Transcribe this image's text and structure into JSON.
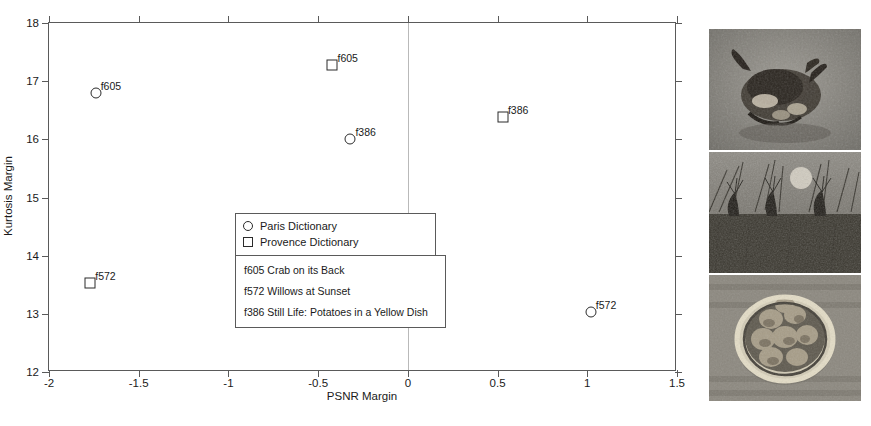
{
  "chart_data": {
    "type": "scatter",
    "title": "",
    "xlabel": "PSNR Margin",
    "ylabel": "Kurtosis Margin",
    "xlim": [
      -2,
      1.5
    ],
    "ylim": [
      12,
      18
    ],
    "xticks": [
      "-2",
      "-1.5",
      "-1",
      "-0.5",
      "0",
      "0.5",
      "1",
      "1.5"
    ],
    "xtick_values": [
      -2,
      -1.5,
      -1,
      -0.5,
      0,
      0.5,
      1,
      1.5
    ],
    "yticks": [
      "12",
      "13",
      "14",
      "15",
      "16",
      "17",
      "18"
    ],
    "ytick_values": [
      12,
      13,
      14,
      15,
      16,
      17,
      18
    ],
    "grid": false,
    "reference_line_x": 0,
    "legend_position": "center-left",
    "series": [
      {
        "name": "Paris Dictionary",
        "marker": "circle",
        "points": [
          {
            "label": "f605",
            "x": -1.74,
            "y": 16.8
          },
          {
            "label": "f386",
            "x": -0.32,
            "y": 16.0
          },
          {
            "label": "f572",
            "x": 1.02,
            "y": 13.03
          }
        ]
      },
      {
        "name": "Provence Dictionary",
        "marker": "square",
        "points": [
          {
            "label": "f605",
            "x": -0.42,
            "y": 17.28
          },
          {
            "label": "f386",
            "x": 0.53,
            "y": 16.38
          },
          {
            "label": "f572",
            "x": -1.77,
            "y": 13.53
          }
        ]
      }
    ],
    "annotations": [
      "f605 Crab on its Back",
      "f572 Willows at Sunset",
      "f386 Still Life: Potatoes in a Yellow Dish"
    ]
  },
  "legend": {
    "entries": [
      {
        "symbol": "circle",
        "label": "Paris Dictionary"
      },
      {
        "symbol": "square",
        "label": "Provence Dictionary"
      }
    ]
  },
  "captions": {
    "lines": [
      "f605 Crab on its Back",
      "f572 Willows at Sunset",
      "f386 Still Life: Potatoes in a Yellow Dish"
    ]
  },
  "thumbnails": [
    {
      "name": "crab-on-its-back-thumbnail",
      "id": "f605",
      "alt": "Crab on its Back"
    },
    {
      "name": "willows-at-sunset-thumbnail",
      "id": "f572",
      "alt": "Willows at Sunset"
    },
    {
      "name": "potatoes-in-a-yellow-dish-thumbnail",
      "id": "f386",
      "alt": "Still Life: Potatoes in a Yellow Dish"
    }
  ],
  "colors": {
    "axis": "#5a5a5a",
    "marker": "#2b2b2b",
    "reference_line": "#b9b9b9",
    "text": "#1a1a1a",
    "background": "#ffffff"
  }
}
